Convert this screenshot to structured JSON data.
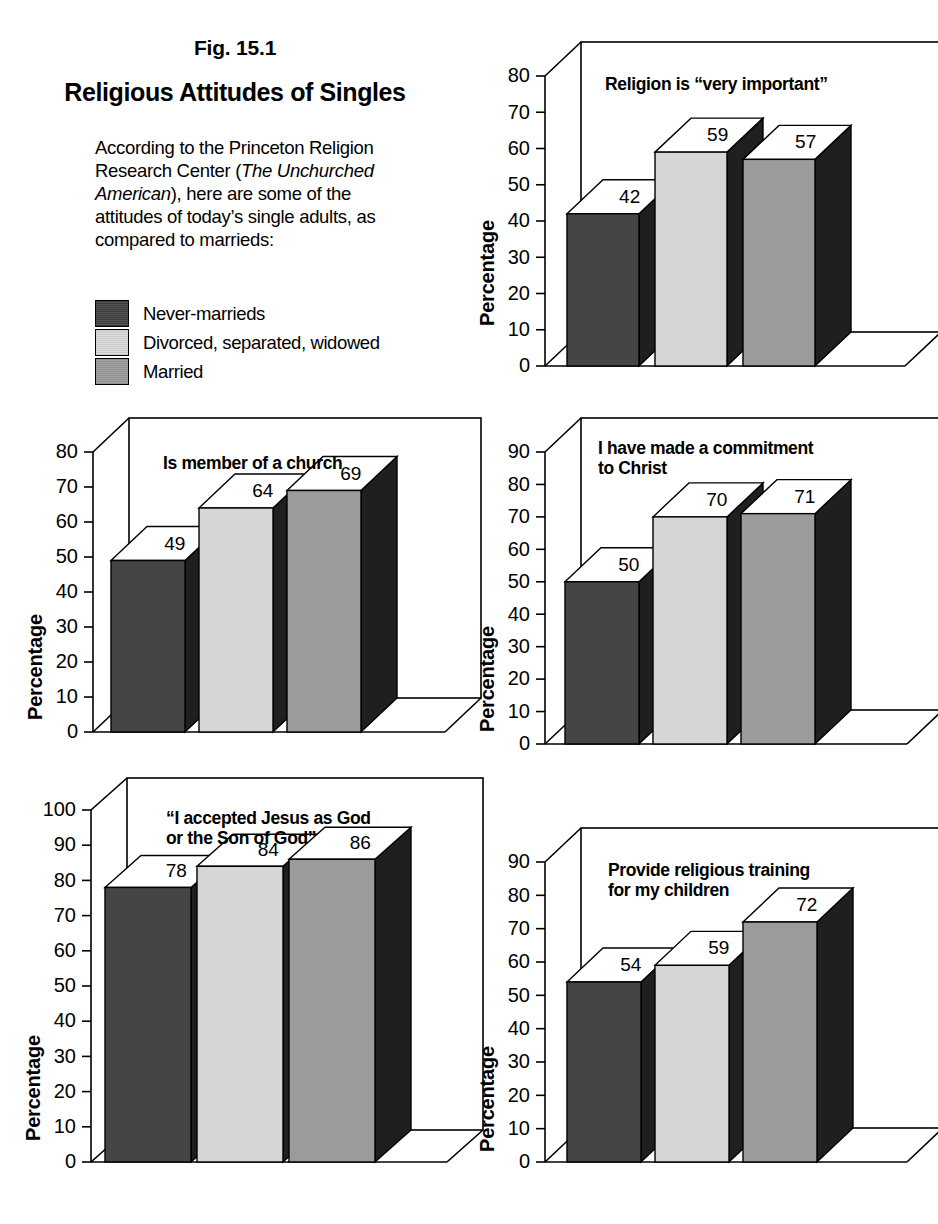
{
  "header": {
    "fig_label": "Fig. 15.1",
    "title": "Religious Attitudes of Singles",
    "intro_1": "According to the Princeton Religion Research Center (",
    "intro_italic": "The Unchurched American",
    "intro_2": "), here are some of the attitudes of today’s single adults, as compared to marrieds:"
  },
  "legend": {
    "items": [
      {
        "label": "Never-marrieds",
        "color": "#454545",
        "swatch": "sw-dark"
      },
      {
        "label": "Divorced, separated, widowed",
        "color": "#d6d6d6",
        "swatch": "sw-light"
      },
      {
        "label": "Married",
        "color": "#9b9b9b",
        "swatch": "sw-mid"
      }
    ]
  },
  "axis_label": "Percentage",
  "chart_data": [
    {
      "id": "religion-very-important",
      "type": "bar",
      "title": "Religion is “very important”",
      "categories": [
        "Never-marrieds",
        "Divorced, separated, widowed",
        "Married"
      ],
      "values": [
        42,
        59,
        57
      ],
      "xlabel": "",
      "ylabel": "Percentage",
      "ylim": [
        0,
        80
      ],
      "yticks": [
        0,
        10,
        20,
        30,
        40,
        50,
        60,
        70,
        80
      ],
      "grid": false,
      "legend": "external"
    },
    {
      "id": "is-member-of-a-church",
      "type": "bar",
      "title": "Is member of a church",
      "categories": [
        "Never-marrieds",
        "Divorced, separated, widowed",
        "Married"
      ],
      "values": [
        49,
        64,
        69
      ],
      "xlabel": "",
      "ylabel": "Percentage",
      "ylim": [
        0,
        80
      ],
      "yticks": [
        0,
        10,
        20,
        30,
        40,
        50,
        60,
        70,
        80
      ],
      "grid": false,
      "legend": "external"
    },
    {
      "id": "commitment-to-christ",
      "type": "bar",
      "title": "I have made a commitment to Christ",
      "categories": [
        "Never-marrieds",
        "Divorced, separated, widowed",
        "Married"
      ],
      "values": [
        50,
        70,
        71
      ],
      "xlabel": "",
      "ylabel": "Percentage",
      "ylim": [
        0,
        90
      ],
      "yticks": [
        0,
        10,
        20,
        30,
        40,
        50,
        60,
        70,
        80,
        90
      ],
      "grid": false,
      "legend": "external"
    },
    {
      "id": "accepted-jesus",
      "type": "bar",
      "title": "“I accepted Jesus as God or the Son of God”",
      "categories": [
        "Never-marrieds",
        "Divorced, separated, widowed",
        "Married"
      ],
      "values": [
        78,
        84,
        86
      ],
      "xlabel": "",
      "ylabel": "Percentage",
      "ylim": [
        0,
        100
      ],
      "yticks": [
        0,
        10,
        20,
        30,
        40,
        50,
        60,
        70,
        80,
        90,
        100
      ],
      "grid": false,
      "legend": "external"
    },
    {
      "id": "religious-training-children",
      "type": "bar",
      "title": "Provide religious training for my children",
      "categories": [
        "Never-marrieds",
        "Divorced, separated, widowed",
        "Married"
      ],
      "values": [
        54,
        59,
        72
      ],
      "xlabel": "",
      "ylabel": "Percentage",
      "ylim": [
        0,
        90
      ],
      "yticks": [
        0,
        10,
        20,
        30,
        40,
        50,
        60,
        70,
        80,
        90
      ],
      "grid": false,
      "legend": "external"
    }
  ],
  "chart_titles": {
    "c0_l1": "Religion is “very important”",
    "c1_l1": "Is member of a church",
    "c2_l1": "I have made a commitment",
    "c2_l2": "to Christ",
    "c3_l1": "“I accepted Jesus as God",
    "c3_l2": "or the Son of God”",
    "c4_l1": "Provide religious training",
    "c4_l2": "for my children"
  }
}
